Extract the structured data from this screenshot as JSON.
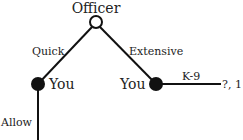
{
  "tree": {
    "root": {
      "label": "Officer",
      "type": "hollow"
    },
    "edges": {
      "left": {
        "label": "Quick"
      },
      "right": {
        "label": "Extensive"
      },
      "right_out": {
        "label": "K-9"
      },
      "left_out": {
        "label": "Allow"
      }
    },
    "nodes": {
      "left": {
        "label": "You",
        "type": "filled"
      },
      "right": {
        "label": "You",
        "type": "filled"
      }
    },
    "payoffs": {
      "k9": "?, 1"
    }
  },
  "colors": {
    "line": "#111111",
    "text": "#222222",
    "background": "#ffffff"
  }
}
